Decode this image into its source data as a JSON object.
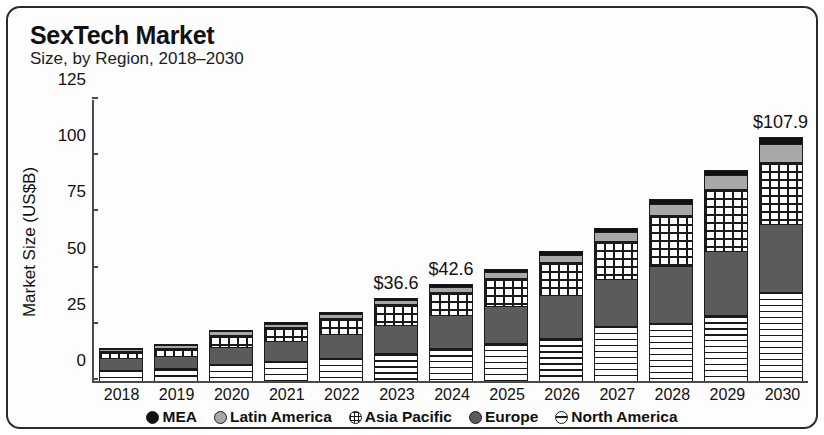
{
  "chart_data": {
    "type": "bar",
    "subtype": "stacked-bar",
    "title": "SexTech Market",
    "subtitle": "Size, by Region, 2018–2030",
    "xlabel": "",
    "ylabel": "Market Size (US$B)",
    "ylim": [
      0,
      125
    ],
    "yticks": [
      0,
      25,
      50,
      75,
      100,
      125
    ],
    "grid": false,
    "legend_position": "bottom",
    "categories": [
      "2018",
      "2019",
      "2020",
      "2021",
      "2022",
      "2023",
      "2024",
      "2025",
      "2026",
      "2027",
      "2028",
      "2029",
      "2030"
    ],
    "series": [
      {
        "name": "North America",
        "pattern": "horizontal-lines",
        "color": "#ffffff",
        "values": [
          4.6,
          5.2,
          7.0,
          8.4,
          10.0,
          12.1,
          14.2,
          16.3,
          18.7,
          24.0,
          25.4,
          29.0,
          39.0
        ]
      },
      {
        "name": "Europe",
        "pattern": "solid-dark-gray",
        "color": "#5b5b5b",
        "values": [
          5.0,
          5.4,
          7.6,
          8.8,
          10.4,
          12.6,
          14.6,
          16.8,
          19.3,
          21.0,
          25.2,
          28.5,
          30.5
        ]
      },
      {
        "name": "Asia Pacific",
        "pattern": "checkered-grid",
        "color": "#ffffff",
        "values": [
          3.3,
          3.8,
          5.6,
          6.3,
          7.2,
          9.0,
          10.3,
          12.2,
          14.4,
          17.0,
          22.8,
          27.5,
          27.5
        ]
      },
      {
        "name": "Latin America",
        "pattern": "light-gray",
        "color": "#a8a8a8",
        "values": [
          0.9,
          1.0,
          1.4,
          1.6,
          1.8,
          2.1,
          2.5,
          2.9,
          3.4,
          4.0,
          5.0,
          6.0,
          8.2
        ]
      },
      {
        "name": "MEA",
        "pattern": "solid-black",
        "color": "#111111",
        "values": [
          0.4,
          0.5,
          0.6,
          0.7,
          0.8,
          0.8,
          1.0,
          1.2,
          1.4,
          1.6,
          2.0,
          2.3,
          2.7
        ]
      }
    ],
    "totals": [
      14.2,
      15.9,
      22.2,
      25.8,
      30.2,
      36.6,
      42.6,
      49.4,
      57.2,
      67.6,
      80.4,
      93.3,
      107.9
    ],
    "point_labels": [
      {
        "category": "2023",
        "text": "$36.6"
      },
      {
        "category": "2024",
        "text": "$42.6"
      },
      {
        "category": "2030",
        "text": "$107.9"
      }
    ]
  },
  "legend": {
    "items": [
      {
        "label": "MEA",
        "swatch": "mea-swatch-icon"
      },
      {
        "label": "Latin America",
        "swatch": "latin-america-swatch-icon"
      },
      {
        "label": "Asia Pacific",
        "swatch": "asia-pacific-swatch-icon"
      },
      {
        "label": "Europe",
        "swatch": "europe-swatch-icon"
      },
      {
        "label": "North America",
        "swatch": "north-america-swatch-icon"
      }
    ]
  }
}
